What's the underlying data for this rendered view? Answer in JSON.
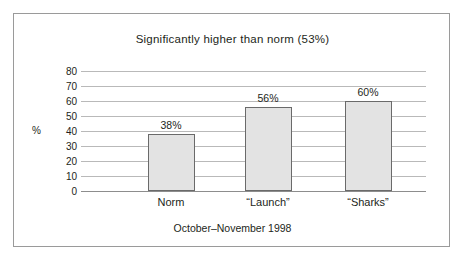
{
  "chart_data": {
    "type": "bar",
    "title": "Significantly higher than norm (53%)",
    "categories": [
      "Norm",
      "“Launch”",
      "“Sharks”"
    ],
    "values": [
      38,
      56,
      60
    ],
    "value_labels": [
      "38%",
      "56%",
      "60%"
    ],
    "xlabel": "",
    "ylabel": "%",
    "ylim": [
      0,
      80
    ],
    "yticks": [
      80,
      70,
      60,
      50,
      40,
      30,
      20,
      10,
      0
    ],
    "ytick_labels": [
      "80",
      "70",
      "60",
      "50",
      "40",
      "30",
      "20",
      "10",
      "0"
    ],
    "caption": "October–November 1998",
    "grid": true,
    "legend": "none",
    "bar_fill_color": "#e3e3e3",
    "bar_border_color": "#6a6a6a",
    "gridline_color": "#b9b9b9",
    "text_color": "#231f20",
    "frame_color": "#9a9a9a"
  }
}
